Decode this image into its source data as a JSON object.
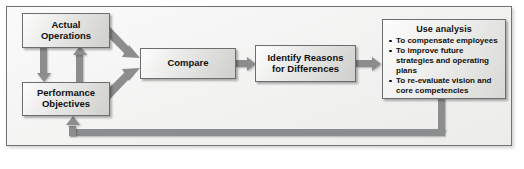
{
  "diagram": {
    "nodes": {
      "actual_operations": {
        "line1": "Actual",
        "line2": "Operations"
      },
      "performance_objectives": {
        "line1": "Performance",
        "line2": "Objectives"
      },
      "compare": {
        "line1": "Compare"
      },
      "identify_reasons": {
        "line1": "Identify Reasons",
        "line2": "for Differences"
      },
      "use_analysis": {
        "title": "Use analysis",
        "bullets": [
          "To compensate employees",
          "To improve future strategies and operating plans",
          "To re-evaluate vision and core competencies"
        ]
      }
    },
    "edges": [
      {
        "from": "actual_operations",
        "to": "compare",
        "style": "diagonal-down-right"
      },
      {
        "from": "performance_objectives",
        "to": "compare",
        "style": "diagonal-up-right"
      },
      {
        "from": "actual_operations",
        "to": "performance_objectives",
        "style": "vertical-down"
      },
      {
        "from": "performance_objectives",
        "to": "actual_operations",
        "style": "vertical-up"
      },
      {
        "from": "compare",
        "to": "identify_reasons",
        "style": "horizontal-right"
      },
      {
        "from": "identify_reasons",
        "to": "use_analysis",
        "style": "horizontal-right"
      },
      {
        "from": "use_analysis",
        "to": "performance_objectives",
        "style": "feedback-loop"
      }
    ],
    "colors": {
      "arrow": "#8b8d8e",
      "box_border": "#6b6d70",
      "frame_border": "#6f7175",
      "text": "#101010",
      "background": "#f2f2f1"
    }
  }
}
